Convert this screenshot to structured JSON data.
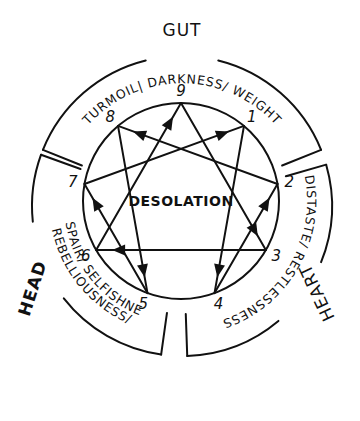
{
  "diagram": {
    "center_label": "DESOLATION",
    "circle": {
      "cx": 181,
      "cy": 201,
      "r": 98
    },
    "points": [
      {
        "id": "9",
        "label": "9",
        "angle_deg": 0
      },
      {
        "id": "1",
        "label": "1",
        "angle_deg": 40
      },
      {
        "id": "2",
        "label": "2",
        "angle_deg": 80
      },
      {
        "id": "3",
        "label": "3",
        "angle_deg": 120
      },
      {
        "id": "4",
        "label": "4",
        "angle_deg": 160
      },
      {
        "id": "5",
        "label": "5",
        "angle_deg": 200
      },
      {
        "id": "6",
        "label": "6",
        "angle_deg": 240
      },
      {
        "id": "7",
        "label": "7",
        "angle_deg": 280
      },
      {
        "id": "8",
        "label": "8",
        "angle_deg": 320
      }
    ],
    "arrows": [
      {
        "from": "9",
        "to": "3"
      },
      {
        "from": "3",
        "to": "6"
      },
      {
        "from": "6",
        "to": "9"
      },
      {
        "from": "1",
        "to": "4"
      },
      {
        "from": "4",
        "to": "2"
      },
      {
        "from": "2",
        "to": "8"
      },
      {
        "from": "8",
        "to": "5"
      },
      {
        "from": "5",
        "to": "7"
      },
      {
        "from": "7",
        "to": "1"
      }
    ],
    "centers": [
      {
        "id": "gut",
        "title": "GUT",
        "band_text": "TURMOIL| DARKNESS/ WEIGHT",
        "start_deg": -68,
        "end_deg": 68
      },
      {
        "id": "heart",
        "title": "HEART",
        "band_text": "DISTASTE/ RESTLESSNESS",
        "start_deg": 74,
        "end_deg": 178
      },
      {
        "id": "head",
        "title": "HEAD",
        "band_text_outer": "REBELLIOUSNESS/",
        "band_text_inner": "DESPAIR/ SELFISHNESS",
        "start_deg": 188,
        "end_deg": 290
      }
    ]
  },
  "colors": {
    "ink": "#111111",
    "paper": "#ffffff"
  }
}
